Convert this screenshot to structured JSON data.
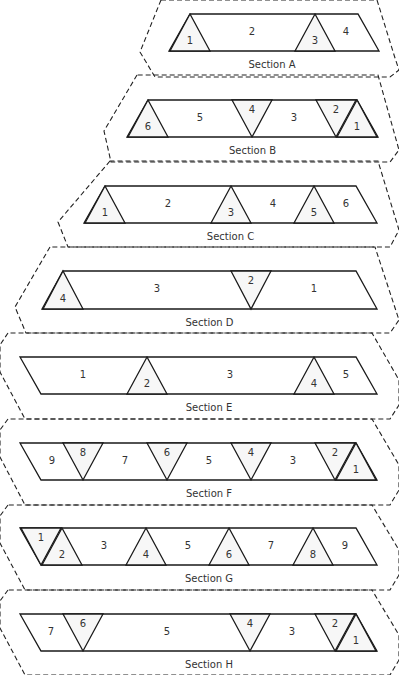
{
  "diagram": {
    "sections": [
      {
        "id": "A",
        "label": "Section A",
        "strip_top": 14,
        "strip_bottom": 51,
        "left_top": 190,
        "left_bottom": 169,
        "right_top": 358,
        "right_bottom": 379,
        "outline": [
          [
            161,
            0
          ],
          [
            140,
            52
          ],
          [
            155,
            77
          ],
          [
            390,
            77
          ],
          [
            399,
            70
          ],
          [
            395,
            58
          ],
          [
            377,
            0
          ]
        ],
        "triangles": [
          {
            "dir": "up",
            "center": 190,
            "label": "1"
          },
          {
            "dir": "up",
            "center": 315,
            "label": "3"
          }
        ],
        "regions": [
          {
            "x": 252,
            "label": "2"
          },
          {
            "x": 346,
            "label": "4"
          }
        ]
      },
      {
        "id": "B",
        "label": "Section B",
        "strip_top": 100,
        "strip_bottom": 137,
        "left_top": 148,
        "left_bottom": 127,
        "right_top": 357,
        "right_bottom": 378,
        "outline": [
          [
            137,
            75
          ],
          [
            104,
            131
          ],
          [
            111,
            162
          ],
          [
            390,
            162
          ],
          [
            399,
            150
          ],
          [
            378,
            75
          ]
        ],
        "triangles": [
          {
            "dir": "up",
            "center": 148,
            "label": "6"
          },
          {
            "dir": "down",
            "center": 252,
            "label": "4"
          },
          {
            "dir": "down",
            "center": 336,
            "label": "2"
          },
          {
            "dir": "up",
            "center": 357,
            "label": "1"
          }
        ],
        "regions": [
          {
            "x": 200,
            "label": "5"
          },
          {
            "x": 294,
            "label": "3"
          }
        ]
      },
      {
        "id": "C",
        "label": "Section C",
        "strip_top": 186,
        "strip_bottom": 223,
        "left_top": 105,
        "left_bottom": 84,
        "right_top": 356,
        "right_bottom": 377,
        "outline": [
          [
            110,
            161
          ],
          [
            58,
            222
          ],
          [
            68,
            247
          ],
          [
            390,
            247
          ],
          [
            399,
            230
          ],
          [
            378,
            161
          ]
        ],
        "triangles": [
          {
            "dir": "up",
            "center": 105,
            "label": "1"
          },
          {
            "dir": "up",
            "center": 231,
            "label": "3"
          },
          {
            "dir": "up",
            "center": 314,
            "label": "5"
          }
        ],
        "regions": [
          {
            "x": 168,
            "label": "2"
          },
          {
            "x": 273,
            "label": "4"
          },
          {
            "x": 346,
            "label": "6"
          }
        ]
      },
      {
        "id": "D",
        "label": "Section D",
        "strip_top": 271,
        "strip_bottom": 309,
        "left_top": 63,
        "left_bottom": 42,
        "right_top": 356,
        "right_bottom": 377,
        "outline": [
          [
            50,
            247
          ],
          [
            15,
            307
          ],
          [
            26,
            333
          ],
          [
            390,
            333
          ],
          [
            399,
            320
          ],
          [
            375,
            247
          ]
        ],
        "triangles": [
          {
            "dir": "up",
            "center": 63,
            "label": "4"
          },
          {
            "dir": "down",
            "center": 251,
            "label": "2"
          }
        ],
        "regions": [
          {
            "x": 157,
            "label": "3"
          },
          {
            "x": 314,
            "label": "1"
          }
        ]
      },
      {
        "id": "E",
        "label": "Section E",
        "strip_top": 357,
        "strip_bottom": 394,
        "left_top": 20,
        "left_bottom": 41,
        "right_top": 356,
        "right_bottom": 377,
        "outline": [
          [
            8,
            333
          ],
          [
            0,
            345
          ],
          [
            0,
            372
          ],
          [
            25,
            419
          ],
          [
            390,
            419
          ],
          [
            399,
            405
          ],
          [
            399,
            380
          ],
          [
            372,
            333
          ]
        ],
        "triangles": [
          {
            "dir": "up",
            "center": 147,
            "label": "2"
          },
          {
            "dir": "up",
            "center": 314,
            "label": "4"
          }
        ],
        "regions": [
          {
            "x": 83,
            "label": "1"
          },
          {
            "x": 230,
            "label": "3"
          },
          {
            "x": 346,
            "label": "5"
          }
        ]
      },
      {
        "id": "F",
        "label": "Section F",
        "strip_top": 443,
        "strip_bottom": 480,
        "left_top": 20,
        "left_bottom": 41,
        "right_top": 356,
        "right_bottom": 377,
        "outline": [
          [
            8,
            419
          ],
          [
            0,
            430
          ],
          [
            0,
            457
          ],
          [
            25,
            505
          ],
          [
            390,
            505
          ],
          [
            399,
            490
          ],
          [
            399,
            465
          ],
          [
            372,
            419
          ]
        ],
        "triangles": [
          {
            "dir": "down",
            "center": 83,
            "label": "8"
          },
          {
            "dir": "down",
            "center": 167,
            "label": "6"
          },
          {
            "dir": "down",
            "center": 251,
            "label": "4"
          },
          {
            "dir": "down",
            "center": 335,
            "label": "2"
          },
          {
            "dir": "up",
            "center": 356,
            "label": "1"
          }
        ],
        "regions": [
          {
            "x": 52,
            "label": "9"
          },
          {
            "x": 125,
            "label": "7"
          },
          {
            "x": 209,
            "label": "5"
          },
          {
            "x": 293,
            "label": "3"
          }
        ]
      },
      {
        "id": "G",
        "label": "Section G",
        "strip_top": 528,
        "strip_bottom": 565,
        "left_top": 20,
        "left_bottom": 41,
        "right_top": 356,
        "right_bottom": 377,
        "outline": [
          [
            8,
            505
          ],
          [
            0,
            516
          ],
          [
            0,
            543
          ],
          [
            25,
            590
          ],
          [
            390,
            590
          ],
          [
            399,
            575
          ],
          [
            399,
            550
          ],
          [
            372,
            505
          ]
        ],
        "triangles": [
          {
            "dir": "down",
            "center": 41,
            "label": "1"
          },
          {
            "dir": "up",
            "center": 62,
            "label": "2"
          },
          {
            "dir": "up",
            "center": 146,
            "label": "4"
          },
          {
            "dir": "up",
            "center": 229,
            "label": "6"
          },
          {
            "dir": "up",
            "center": 313,
            "label": "8"
          }
        ],
        "regions": [
          {
            "x": 104,
            "label": "3"
          },
          {
            "x": 188,
            "label": "5"
          },
          {
            "x": 271,
            "label": "7"
          },
          {
            "x": 345,
            "label": "9"
          }
        ]
      },
      {
        "id": "H",
        "label": "Section H",
        "strip_top": 614,
        "strip_bottom": 651,
        "left_top": 20,
        "left_bottom": 41,
        "right_top": 356,
        "right_bottom": 377,
        "outline": [
          [
            8,
            590
          ],
          [
            0,
            601
          ],
          [
            0,
            628
          ],
          [
            25,
            675
          ],
          [
            390,
            675
          ],
          [
            399,
            660
          ],
          [
            399,
            635
          ],
          [
            372,
            590
          ]
        ],
        "triangles": [
          {
            "dir": "down",
            "center": 83,
            "label": "6"
          },
          {
            "dir": "down",
            "center": 250,
            "label": "4"
          },
          {
            "dir": "down",
            "center": 335,
            "label": "2"
          },
          {
            "dir": "up",
            "center": 356,
            "label": "1"
          }
        ],
        "regions": [
          {
            "x": 51,
            "label": "7"
          },
          {
            "x": 167,
            "label": "5"
          },
          {
            "x": 292,
            "label": "3"
          }
        ]
      }
    ],
    "triangle_half_width": 20,
    "colors": {
      "stroke": "#1a1a1a",
      "triangle_fill": "#f7f7f7",
      "outline": "#222222",
      "text": "#333333"
    }
  }
}
